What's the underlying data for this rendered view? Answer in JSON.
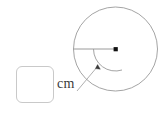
{
  "figure": {
    "kind": "circle-radius-diagram",
    "stroke_color": "#9a9a9a",
    "dot_color": "#111111",
    "background_color": "#ffffff",
    "circle": {
      "cx": 115.5,
      "cy": 49,
      "r": 42
    },
    "center_dot": {
      "cx": 115.5,
      "cy": 49,
      "size": 4
    },
    "radius_line": {
      "x1": 73.5,
      "y1": 49,
      "x2": 115.5,
      "y2": 49
    },
    "angle_arc": {
      "cx": 115.5,
      "cy": 49,
      "r": 22,
      "start_deg": 180,
      "end_deg": 287
    },
    "arrow_tip": {
      "x": 98,
      "y": 66
    },
    "leader_line": {
      "x1": 98,
      "y1": 66,
      "x2": 77,
      "y2": 91
    }
  },
  "answer": {
    "value": "",
    "placeholder": ""
  },
  "unit": {
    "label": "cm"
  }
}
